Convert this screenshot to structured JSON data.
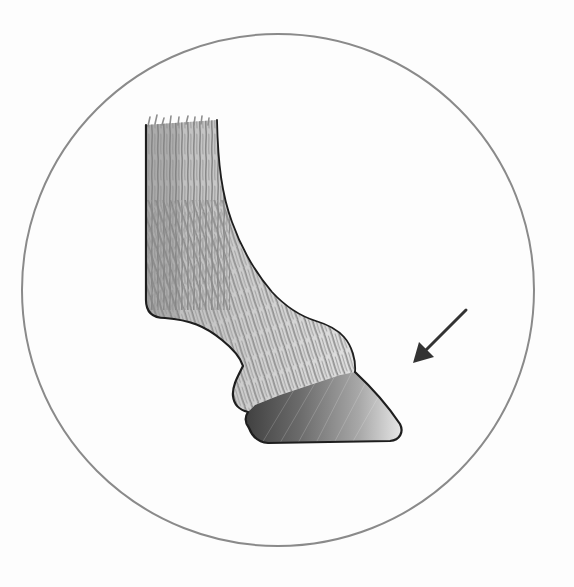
{
  "illustration": {
    "subject": "horse lower leg and hoof, pencil drawing",
    "background_color": "#fdfdfd",
    "frame": {
      "shape": "circle",
      "cx": 278,
      "cy": 290,
      "r": 256,
      "stroke_color": "#8a8a8a",
      "stroke_width": 2
    },
    "arrow": {
      "points_to": "hoof",
      "from": [
        466,
        310
      ],
      "to": [
        413,
        363
      ],
      "color": "#333333"
    },
    "colors": {
      "outline": "#1e1e1e",
      "hair_light": "#d4d4d4",
      "hair_mid": "#9a9a9a",
      "hair_dark": "#6a6a6a",
      "hoof_dark": "#3c3c3c",
      "hoof_light": "#f2f2f2"
    }
  }
}
